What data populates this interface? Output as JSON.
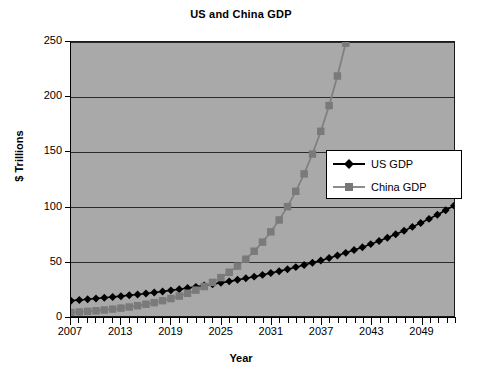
{
  "chart_data": {
    "type": "line",
    "title": "US and China GDP",
    "xlabel": "Year",
    "ylabel": "$ Trillions",
    "ylim": [
      0,
      250
    ],
    "yticks": [
      0,
      50,
      100,
      150,
      200,
      250
    ],
    "ytick_labels": [
      "0",
      "50",
      "100",
      "150",
      "200",
      "250"
    ],
    "xlim": [
      2007,
      2053
    ],
    "xtick_labels": [
      "2007",
      "2013",
      "2019",
      "2025",
      "2031",
      "2037",
      "2043",
      "2049"
    ],
    "xtick_values": [
      2007,
      2013,
      2019,
      2025,
      2031,
      2037,
      2043,
      2049
    ],
    "grid": "horizontal",
    "legend_position": "center-right",
    "x": [
      2007,
      2008,
      2009,
      2010,
      2011,
      2012,
      2013,
      2014,
      2015,
      2016,
      2017,
      2018,
      2019,
      2020,
      2021,
      2022,
      2023,
      2024,
      2025,
      2026,
      2027,
      2028,
      2029,
      2030,
      2031,
      2032,
      2033,
      2034,
      2035,
      2036,
      2037,
      2038,
      2039,
      2040,
      2041,
      2042,
      2043,
      2044,
      2045,
      2046,
      2047,
      2048,
      2049,
      2050,
      2051,
      2052,
      2053
    ],
    "series": [
      {
        "name": "US GDP",
        "color": "#000000",
        "marker": "diamond",
        "values": [
          14.0,
          14.6,
          15.2,
          15.9,
          16.6,
          17.3,
          18.1,
          18.9,
          19.7,
          20.6,
          21.5,
          22.4,
          23.4,
          24.4,
          25.5,
          26.6,
          27.8,
          29.0,
          30.3,
          31.6,
          33.0,
          34.4,
          35.9,
          37.5,
          39.2,
          40.9,
          42.7,
          44.6,
          46.5,
          48.6,
          50.7,
          52.9,
          55.2,
          57.6,
          60.2,
          62.8,
          65.6,
          68.4,
          71.4,
          74.6,
          77.8,
          81.3,
          84.8,
          88.6,
          92.4,
          96.5,
          100.7
        ]
      },
      {
        "name": "China GDP",
        "color": "#808080",
        "marker": "square",
        "values": [
          3.2,
          3.7,
          4.2,
          4.8,
          5.5,
          6.3,
          7.2,
          8.2,
          9.4,
          10.7,
          12.2,
          14.0,
          15.9,
          18.2,
          20.7,
          23.6,
          26.9,
          30.7,
          35.0,
          39.9,
          45.5,
          51.9,
          59.1,
          67.4,
          76.8,
          87.6,
          99.8,
          113.8,
          129.7,
          147.8,
          168.5,
          192.0,
          219.0,
          249.0,
          284.0,
          324.0,
          369.0,
          421.0,
          480.0,
          547.0,
          623.0,
          710.0,
          810.0,
          923.0,
          1052.0,
          1199.0,
          1367.0
        ]
      }
    ]
  },
  "legend": {
    "entries": [
      {
        "label": "US GDP",
        "color": "#000000",
        "marker": "diamond"
      },
      {
        "label": "China GDP",
        "color": "#808080",
        "marker": "square"
      }
    ]
  }
}
